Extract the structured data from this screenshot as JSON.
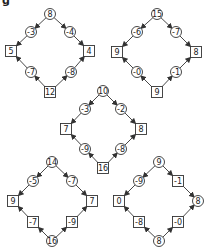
{
  "corner_label": "g",
  "colors": {
    "stroke": "#333333",
    "text": "#222222",
    "background": "#ffffff"
  },
  "diagrams": [
    {
      "id": "top-left",
      "nodes": [
        {
          "id": "t",
          "shape": "circle",
          "label": "8",
          "x": 50,
          "y": 14
        },
        {
          "id": "ul",
          "shape": "circle",
          "label": "-3",
          "x": 31,
          "y": 32
        },
        {
          "id": "ur",
          "shape": "circle",
          "label": "-4",
          "x": 70,
          "y": 32
        },
        {
          "id": "l",
          "shape": "box",
          "label": "5",
          "x": 11,
          "y": 51
        },
        {
          "id": "r",
          "shape": "box",
          "label": "4",
          "x": 89,
          "y": 51
        },
        {
          "id": "ll",
          "shape": "circle",
          "label": "-7",
          "x": 31,
          "y": 72
        },
        {
          "id": "lr",
          "shape": "circle",
          "label": "-8",
          "x": 71,
          "y": 72
        },
        {
          "id": "b",
          "shape": "box",
          "label": "12",
          "x": 50,
          "y": 92
        }
      ],
      "edges": [
        [
          "t",
          "ul"
        ],
        [
          "ul",
          "l"
        ],
        [
          "t",
          "ur"
        ],
        [
          "ur",
          "r"
        ],
        [
          "b",
          "ll"
        ],
        [
          "ll",
          "l"
        ],
        [
          "b",
          "lr"
        ],
        [
          "lr",
          "r"
        ]
      ]
    },
    {
      "id": "top-right",
      "nodes": [
        {
          "id": "t",
          "shape": "circle",
          "label": "15",
          "x": 157,
          "y": 14
        },
        {
          "id": "ul",
          "shape": "circle",
          "label": "-6",
          "x": 137,
          "y": 32
        },
        {
          "id": "ur",
          "shape": "circle",
          "label": "-7",
          "x": 176,
          "y": 32
        },
        {
          "id": "l",
          "shape": "box",
          "label": "9",
          "x": 117,
          "y": 52
        },
        {
          "id": "r",
          "shape": "box",
          "label": "8",
          "x": 196,
          "y": 52
        },
        {
          "id": "ll",
          "shape": "circle",
          "label": "-0",
          "x": 137,
          "y": 72
        },
        {
          "id": "lr",
          "shape": "circle",
          "label": "-1",
          "x": 176,
          "y": 72
        },
        {
          "id": "b",
          "shape": "box",
          "label": "9",
          "x": 157,
          "y": 92
        }
      ],
      "edges": [
        [
          "t",
          "ul"
        ],
        [
          "ul",
          "l"
        ],
        [
          "t",
          "ur"
        ],
        [
          "ur",
          "r"
        ],
        [
          "b",
          "ll"
        ],
        [
          "ll",
          "l"
        ],
        [
          "b",
          "lr"
        ],
        [
          "lr",
          "r"
        ]
      ]
    },
    {
      "id": "middle",
      "nodes": [
        {
          "id": "t",
          "shape": "circle",
          "label": "10",
          "x": 103,
          "y": 91
        },
        {
          "id": "ul",
          "shape": "circle",
          "label": "-3",
          "x": 85,
          "y": 109
        },
        {
          "id": "ur",
          "shape": "circle",
          "label": "-2",
          "x": 121,
          "y": 109
        },
        {
          "id": "l",
          "shape": "box",
          "label": "7",
          "x": 66,
          "y": 129
        },
        {
          "id": "r",
          "shape": "box",
          "label": "8",
          "x": 141,
          "y": 129
        },
        {
          "id": "ll",
          "shape": "circle",
          "label": "-9",
          "x": 85,
          "y": 149
        },
        {
          "id": "lr",
          "shape": "circle",
          "label": "-8",
          "x": 121,
          "y": 149
        },
        {
          "id": "b",
          "shape": "box",
          "label": "16",
          "x": 103,
          "y": 168
        }
      ],
      "edges": [
        [
          "t",
          "ul"
        ],
        [
          "ul",
          "l"
        ],
        [
          "t",
          "ur"
        ],
        [
          "ur",
          "r"
        ],
        [
          "b",
          "ll"
        ],
        [
          "ll",
          "l"
        ],
        [
          "b",
          "lr"
        ],
        [
          "lr",
          "r"
        ]
      ]
    },
    {
      "id": "bottom-left",
      "nodes": [
        {
          "id": "t",
          "shape": "circle",
          "label": "14",
          "x": 52,
          "y": 162
        },
        {
          "id": "ul",
          "shape": "circle",
          "label": "-5",
          "x": 33,
          "y": 181
        },
        {
          "id": "ur",
          "shape": "circle",
          "label": "-7",
          "x": 72,
          "y": 181
        },
        {
          "id": "l",
          "shape": "box",
          "label": "9",
          "x": 13,
          "y": 201
        },
        {
          "id": "r",
          "shape": "box",
          "label": "7",
          "x": 92,
          "y": 201
        },
        {
          "id": "ll",
          "shape": "box",
          "label": "-7",
          "x": 33,
          "y": 222
        },
        {
          "id": "lr",
          "shape": "box",
          "label": "-9",
          "x": 72,
          "y": 222
        },
        {
          "id": "b",
          "shape": "circle",
          "label": "16",
          "x": 52,
          "y": 241
        }
      ],
      "edges": [
        [
          "t",
          "ul"
        ],
        [
          "ul",
          "l"
        ],
        [
          "t",
          "ur"
        ],
        [
          "ur",
          "r"
        ],
        [
          "b",
          "ll"
        ],
        [
          "ll",
          "l"
        ],
        [
          "b",
          "lr"
        ],
        [
          "lr",
          "r"
        ]
      ]
    },
    {
      "id": "bottom-right",
      "nodes": [
        {
          "id": "t",
          "shape": "circle",
          "label": "9",
          "x": 159,
          "y": 162
        },
        {
          "id": "ul",
          "shape": "circle",
          "label": "-9",
          "x": 139,
          "y": 181
        },
        {
          "id": "ur",
          "shape": "box",
          "label": "-1",
          "x": 178,
          "y": 181
        },
        {
          "id": "l",
          "shape": "box",
          "label": "0",
          "x": 119,
          "y": 201
        },
        {
          "id": "r",
          "shape": "circle",
          "label": "8",
          "x": 198,
          "y": 201
        },
        {
          "id": "ll",
          "shape": "box",
          "label": "-8",
          "x": 139,
          "y": 222
        },
        {
          "id": "lr",
          "shape": "box",
          "label": "-0",
          "x": 178,
          "y": 222
        },
        {
          "id": "b",
          "shape": "circle",
          "label": "8",
          "x": 159,
          "y": 241
        }
      ],
      "edges": [
        [
          "t",
          "ul"
        ],
        [
          "ul",
          "l"
        ],
        [
          "t",
          "ur"
        ],
        [
          "ur",
          "r"
        ],
        [
          "b",
          "ll"
        ],
        [
          "ll",
          "l"
        ],
        [
          "b",
          "lr"
        ],
        [
          "lr",
          "r"
        ]
      ]
    }
  ]
}
